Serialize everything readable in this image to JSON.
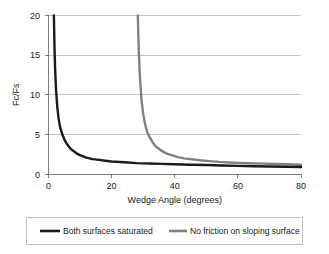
{
  "chart_data": {
    "type": "line",
    "title": "",
    "xlabel": "Wedge Angle (degrees)",
    "ylabel": "Fc/Fs",
    "xlim": [
      0,
      80
    ],
    "ylim": [
      0,
      20
    ],
    "xticks": [
      0,
      20,
      40,
      60,
      80
    ],
    "yticks": [
      0,
      5,
      10,
      15,
      20
    ],
    "xtick_labels": [
      "0",
      "20",
      "40",
      "60",
      "80"
    ],
    "ytick_labels": [
      "0",
      "5",
      "10",
      "15",
      "20"
    ],
    "grid": "horizontal",
    "legend_position": "bottom",
    "series": [
      {
        "name": "Both surfaces saturated",
        "color": "#1a1a1a",
        "linewidth": 2.4,
        "asymptote_x": 1.5,
        "x": [
          1.7,
          1.9,
          2.1,
          2.4,
          2.8,
          3.2,
          3.7,
          4.3,
          5.0,
          6.0,
          7.0,
          8.0,
          9.0,
          10.0,
          12.0,
          14.0,
          16.0,
          18.0,
          20.0,
          24.0,
          28.0,
          32.0,
          36.0,
          40.0,
          45.0,
          50.0,
          55.0,
          60.0,
          65.0,
          70.0,
          75.0,
          80.0
        ],
        "y": [
          20.0,
          16.0,
          13.2,
          10.6,
          8.4,
          7.0,
          5.9,
          5.1,
          4.4,
          3.7,
          3.2,
          2.9,
          2.6,
          2.4,
          2.1,
          1.9,
          1.8,
          1.7,
          1.6,
          1.5,
          1.4,
          1.35,
          1.3,
          1.25,
          1.2,
          1.15,
          1.1,
          1.05,
          1.0,
          0.97,
          0.93,
          0.9
        ]
      },
      {
        "name": "No friction on sloping surface",
        "color": "#808080",
        "linewidth": 2.4,
        "asymptote_x": 28.0,
        "x": [
          28.3,
          28.6,
          29.0,
          29.5,
          30.0,
          30.6,
          31.3,
          32.0,
          33.0,
          34.0,
          35.0,
          36.0,
          37.5,
          39.0,
          41.0,
          43.0,
          45.0,
          48.0,
          51.0,
          54.0,
          57.0,
          60.0,
          64.0,
          68.0,
          72.0,
          76.0,
          80.0
        ],
        "y": [
          20.0,
          15.5,
          12.0,
          9.2,
          7.6,
          6.3,
          5.3,
          4.7,
          4.0,
          3.5,
          3.2,
          2.9,
          2.6,
          2.4,
          2.15,
          2.0,
          1.9,
          1.75,
          1.65,
          1.55,
          1.48,
          1.43,
          1.38,
          1.33,
          1.29,
          1.25,
          1.2
        ]
      }
    ]
  },
  "legend": {
    "entries": [
      {
        "label": "Both surfaces saturated",
        "color": "#1a1a1a"
      },
      {
        "label": "No friction on sloping surface",
        "color": "#808080"
      }
    ]
  },
  "axes": {
    "x_title": "Wedge Angle (degrees)",
    "y_title": "Fc/Fs"
  },
  "colors": {
    "series_black": "#1a1a1a",
    "series_gray": "#808080",
    "gridline": "#aaaaaa",
    "axis": "#6f6f6f",
    "legend_border": "#b4b4b4",
    "background": "#ffffff"
  }
}
